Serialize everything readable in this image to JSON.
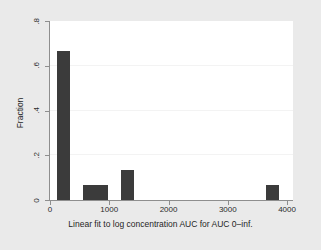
{
  "chart_data": {
    "type": "bar",
    "title": "",
    "subtitle": "",
    "xlabel": "Linear fit to log concentration AUC for AUC 0–inf.",
    "ylabel": "Fraction",
    "xlim": [
      0,
      4100
    ],
    "ylim": [
      0,
      0.8
    ],
    "xticks": [
      0,
      1000,
      2000,
      3000,
      4000
    ],
    "xtick_labels": [
      "0",
      "1000",
      "2000",
      "3000",
      "4000"
    ],
    "yticks": [
      0,
      0.2,
      0.4,
      0.6,
      0.8
    ],
    "ytick_labels": [
      "0",
      ".2",
      ".4",
      ".6",
      ".8"
    ],
    "grid": "horizontal",
    "gridlines_y": [
      0.2,
      0.4,
      0.6
    ],
    "legend": "none",
    "bin_width": 215,
    "bar_color": "#3b3b3b",
    "plot_background": "#ffffff",
    "figure_background": "#eaeaea",
    "axis_color": "#8e8e8e",
    "gridline_color": "#f3f3f3",
    "bars": [
      {
        "x_left": 120,
        "x_right": 335,
        "value": 0.667
      },
      {
        "x_left": 550,
        "x_right": 765,
        "value": 0.067
      },
      {
        "x_left": 765,
        "x_right": 980,
        "value": 0.067
      },
      {
        "x_left": 1195,
        "x_right": 1410,
        "value": 0.133
      },
      {
        "x_left": 3645,
        "x_right": 3860,
        "value": 0.067
      }
    ],
    "categories": [
      "120–335",
      "550–765",
      "765–980",
      "1195–1410",
      "3645–3860"
    ],
    "values": [
      0.667,
      0.067,
      0.067,
      0.133,
      0.067
    ]
  }
}
